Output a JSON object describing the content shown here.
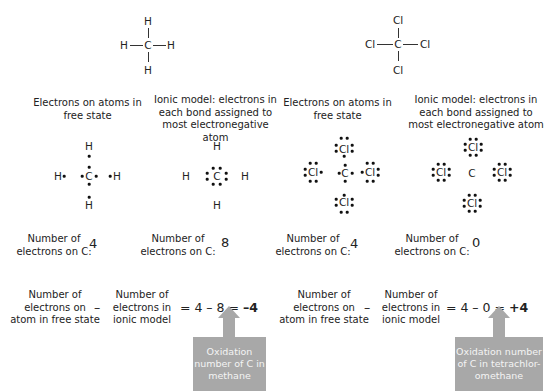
{
  "methane": {
    "structural": {
      "center": "C",
      "top": "H",
      "left": "H",
      "right": "H",
      "bottom": "H"
    },
    "free_state": {
      "header": [
        "Electrons on atoms in",
        "free state"
      ],
      "center": "C",
      "top": "H",
      "left": "H",
      "right": "H",
      "bottom": "H",
      "count_label": [
        "Number of",
        "electrons on C:"
      ],
      "count": "4"
    },
    "ionic": {
      "header": [
        "Ionic model: electrons in",
        "each bond assigned to",
        "most electronegative atom"
      ],
      "center": "C",
      "top": "H",
      "left": "H",
      "right": "H",
      "bottom": "H",
      "count_label": [
        "Number of",
        "electrons on C:"
      ],
      "count": "8"
    },
    "formula": {
      "term1": [
        "Number of",
        "electrons on",
        "atom in free state"
      ],
      "minus": "–",
      "term2": [
        "Number of",
        "electrons in",
        "ionic model"
      ],
      "expr": "= 4 – 8 = ",
      "result": "–4"
    },
    "callout": [
      "Oxidation",
      "number of C in",
      "methane"
    ]
  },
  "tetrachloromethane": {
    "structural": {
      "center": "C",
      "top": "Cl",
      "left": "Cl",
      "right": "Cl",
      "bottom": "Cl"
    },
    "free_state": {
      "header": [
        "Electrons on atoms in",
        "free state"
      ],
      "center": "C",
      "top": "Cl",
      "left": "Cl",
      "right": "Cl",
      "bottom": "Cl",
      "count_label": [
        "Number of",
        "electrons on C:"
      ],
      "count": "4"
    },
    "ionic": {
      "header": [
        "Ionic model: electrons in",
        "each bond assigned to",
        "most electronegative atom"
      ],
      "center": "C",
      "top": "Cl",
      "left": "Cl",
      "right": "Cl",
      "bottom": "Cl",
      "count_label": [
        "Number of",
        "electrons on C:"
      ],
      "count": "0"
    },
    "formula": {
      "term1": [
        "Number of",
        "electrons on",
        "atom in free state"
      ],
      "minus": "–",
      "term2": [
        "Number of",
        "electrons in",
        "ionic model"
      ],
      "expr": "= 4 – 0 = ",
      "result": "+4"
    },
    "callout": [
      "Oxidation number",
      "of C in tetrachlor-",
      "omethane"
    ]
  },
  "colors": {
    "callout_bg": "#a8a8a8",
    "callout_text": "#f4f4f4",
    "text": "#222222"
  }
}
